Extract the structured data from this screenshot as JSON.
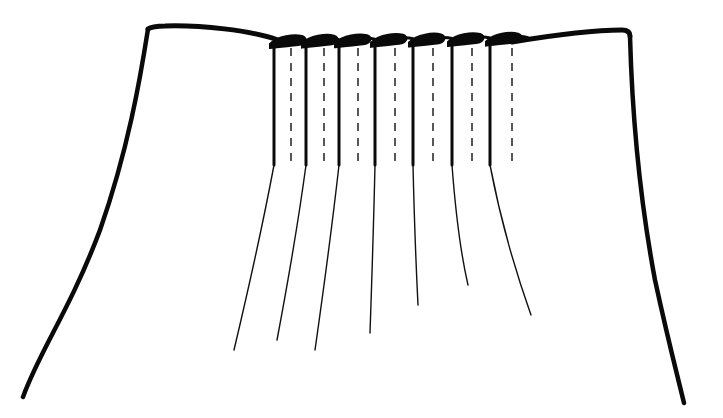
{
  "figure": {
    "type": "line-illustration",
    "pleat_count": 7,
    "colors": {
      "line": "#0a0a0a",
      "background": "#ffffff"
    }
  },
  "pleats": [
    {
      "fold_x": 274,
      "stitch_x": 291,
      "release_end": [
        234,
        350
      ]
    },
    {
      "fold_x": 306,
      "stitch_x": 324,
      "release_end": [
        277,
        340
      ]
    },
    {
      "fold_x": 339,
      "stitch_x": 358,
      "release_end": [
        315,
        350
      ]
    },
    {
      "fold_x": 375,
      "stitch_x": 395,
      "release_end": [
        370,
        333
      ]
    },
    {
      "fold_x": 413,
      "stitch_x": 433,
      "release_end": [
        418,
        305
      ]
    },
    {
      "fold_x": 452,
      "stitch_x": 472,
      "release_end": [
        468,
        285
      ]
    },
    {
      "fold_x": 490,
      "stitch_x": 512,
      "release_end": [
        531,
        315
      ]
    }
  ],
  "stitch_range_y": [
    48,
    162
  ]
}
